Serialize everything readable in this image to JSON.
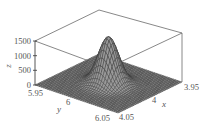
{
  "chart_data": {
    "type": "surface3d",
    "title": "",
    "function": "gaussian peak centered at (x=4.0, y=6.0)",
    "xlabel": "x",
    "ylabel": "y",
    "zlabel": "z",
    "x_range": [
      3.95,
      4.05
    ],
    "y_range": [
      5.95,
      6.05
    ],
    "z_range": [
      0,
      1500
    ],
    "x_ticks": [
      "3.95",
      "4",
      "4.05"
    ],
    "y_ticks": [
      "5.95",
      "6",
      "6.05"
    ],
    "z_ticks": [
      "0",
      "500",
      "1000",
      "1500"
    ],
    "peak": {
      "x": 4.0,
      "y": 6.0,
      "z": 1600
    },
    "peak_sigma": 0.01,
    "grid_resolution": 40,
    "grid": false,
    "legend": "none",
    "colors": {
      "mesh_line": "#3a3a3a",
      "mesh_fill": "#9a9a9a",
      "box": "#6a6a6a"
    }
  }
}
